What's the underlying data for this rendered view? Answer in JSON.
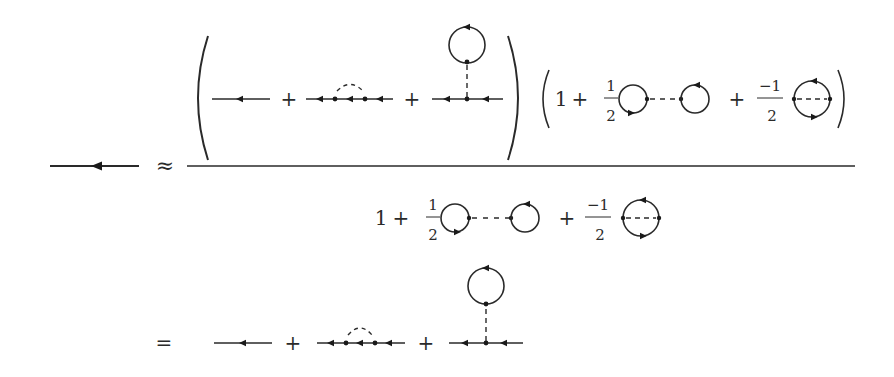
{
  "equation": {
    "lhs": {
      "symbol": "full-propagator",
      "relation": "≈"
    },
    "numerator": {
      "left_paren": "(",
      "right_paren": ")",
      "terms": [
        {
          "diagram": "free-propagator"
        },
        {
          "op": "+"
        },
        {
          "diagram": "exchange-self-energy"
        },
        {
          "op": "+"
        },
        {
          "diagram": "tadpole"
        }
      ],
      "factor": {
        "left_paren": "(",
        "right_paren": ")",
        "one": "1",
        "plus1": "+",
        "coef1_num": "1",
        "coef1_den": "2",
        "diagram1": "dumbbell-vacuum",
        "plus2": "+",
        "coef2_num": "−1",
        "coef2_den": "2",
        "diagram2": "oyster-vacuum"
      }
    },
    "denominator": {
      "one": "1",
      "plus1": "+",
      "coef1_num": "1",
      "coef1_den": "2",
      "diagram1": "dumbbell-vacuum",
      "plus2": "+",
      "coef2_num": "−1",
      "coef2_den": "2",
      "diagram2": "oyster-vacuum"
    },
    "result": {
      "relation": "=",
      "terms": [
        {
          "diagram": "free-propagator"
        },
        {
          "op": "+"
        },
        {
          "diagram": "exchange-self-energy"
        },
        {
          "op": "+"
        },
        {
          "diagram": "tadpole"
        }
      ]
    }
  }
}
